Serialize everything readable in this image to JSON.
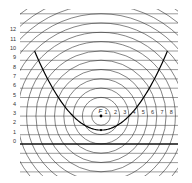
{
  "diagram": {
    "title": "",
    "focus_label": "F",
    "y_axis_labels": [
      "0",
      "1",
      "2",
      "3",
      "4",
      "5",
      "6",
      "7",
      "8",
      "9",
      "10",
      "11",
      "12"
    ],
    "radius_labels": [
      "1",
      "2",
      "3",
      "4",
      "5",
      "6",
      "7",
      "8"
    ],
    "geometry": {
      "unit_px": 9.3,
      "focus": {
        "x": 101,
        "y": 116,
        "level": 3
      },
      "directrix_level": 0,
      "directrix_y": 144,
      "clip": {
        "x1": 20,
        "y1": 9,
        "x2": 178,
        "y2": 176
      },
      "line_levels_min": -3,
      "line_levels_max": 14,
      "circle_count": 18,
      "parabola_max_level": 10
    },
    "colors": {
      "line": "#555555",
      "circle": "#333333",
      "directrix": "#111111",
      "parabola": "#000000"
    }
  }
}
